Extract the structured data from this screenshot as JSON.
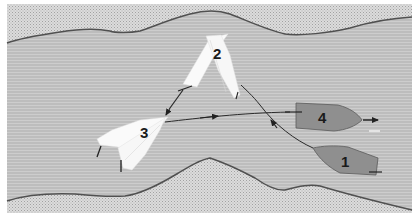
{
  "diagram": {
    "type": "sailing-rules-illustration",
    "colors": {
      "water": "#b9b9b9",
      "water_stripe": "#c9c9c9",
      "shore": "#d4d4d4",
      "shore_dot": "#9a9a9a",
      "shoreline": "#555555",
      "boat_white": "#fafafa",
      "boat_grey": "#8d8d8d",
      "track": "#333333"
    },
    "boats": [
      {
        "id": "1",
        "label": "1",
        "color": "grey",
        "heading": "left / upstream"
      },
      {
        "id": "2",
        "label": "2",
        "color": "white",
        "heading": "tacking (two positions)"
      },
      {
        "id": "3",
        "label": "3",
        "color": "white",
        "heading": "tacking (two positions)"
      },
      {
        "id": "4",
        "label": "4",
        "color": "grey",
        "heading": "right"
      }
    ],
    "tracks": [
      {
        "from": "1",
        "to": "2",
        "arrow": "toward 2"
      },
      {
        "from": "2",
        "to": "3",
        "arrow": "toward 3"
      },
      {
        "from": "3",
        "to": "4",
        "arrow": "toward 4 and beyond"
      }
    ]
  }
}
